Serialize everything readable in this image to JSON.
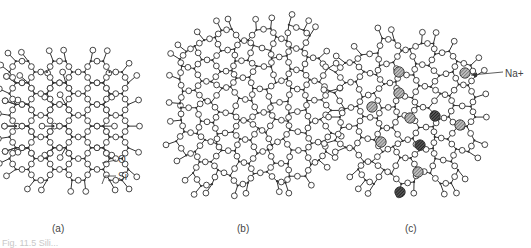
{
  "figure": {
    "panels": [
      {
        "id": "a",
        "label": "(a)",
        "structure": "crystalline silica (ordered hexagonal network)"
      },
      {
        "id": "b",
        "label": "(b)",
        "structure": "amorphous silica glass (random network)"
      },
      {
        "id": "c",
        "label": "(c)",
        "structure": "soda-silica glass (network modified by sodium ions)"
      }
    ],
    "annotations": {
      "oxygen": "O",
      "silicon": "Si",
      "sodium": "Na+"
    },
    "caption_fragment": "Fig. 11.5 Sili...",
    "legend_semantics": {
      "open_circle": "oxygen atom",
      "small_dot": "silicon atom",
      "hatched_circle": "sodium ion"
    },
    "colors": {
      "ink": "#333333",
      "hatch": "#666666",
      "dark_ion": "#2a2a2a"
    },
    "sodium_ion_count": 11
  }
}
